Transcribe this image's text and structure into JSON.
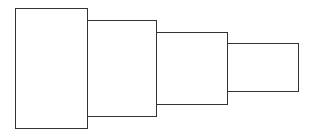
{
  "diagram": {
    "type": "stepped-rectangles",
    "stroke_color": "#333333",
    "fill_color": "#ffffff",
    "boxes": [
      {
        "left": 15,
        "top": 8,
        "width": 73,
        "height": 121
      },
      {
        "left": 86,
        "top": 20,
        "width": 71,
        "height": 97
      },
      {
        "left": 156,
        "top": 32,
        "width": 72,
        "height": 73
      },
      {
        "left": 227,
        "top": 43,
        "width": 72,
        "height": 49
      }
    ]
  }
}
